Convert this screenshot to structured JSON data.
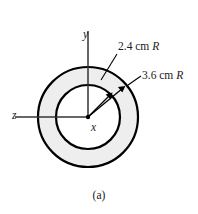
{
  "figure": {
    "caption": "(a)",
    "center": {
      "x": 88,
      "y": 117
    },
    "annulus": {
      "inner_radius_px": 32,
      "outer_radius_px": 50,
      "ring_fill_color": "#eeeeee",
      "inner_fill_color": "#ffffff",
      "stroke_color": "#000000",
      "stroke_width_px": 2.2
    },
    "dimensions": [
      {
        "name": "inner-radius",
        "value": "2.4",
        "unit": "cm",
        "symbol": "R",
        "text": "2.4 cm R"
      },
      {
        "name": "outer-radius",
        "value": "3.6",
        "unit": "cm",
        "symbol": "R",
        "text": "3.6 cm R"
      }
    ],
    "axes": [
      {
        "name": "y-axis",
        "label": "y",
        "direction": "up"
      },
      {
        "name": "z-axis",
        "label": "z",
        "direction": "left"
      },
      {
        "name": "x-axis",
        "label": "x",
        "direction": "out-of-page"
      }
    ],
    "arrows": [
      {
        "name": "inner-radius-arrow",
        "from": "origin",
        "to": "inner-circle",
        "angle_deg": 45
      },
      {
        "name": "outer-radius-arrow",
        "from": "origin",
        "to": "outer-circle",
        "angle_deg": 40
      }
    ]
  },
  "chart_data": {
    "type": "diagram",
    "title": "(a)",
    "annotations": [
      "2.4 cm R",
      "3.6 cm R",
      "y",
      "z",
      "x",
      "(a)"
    ],
    "values": [
      2.4,
      3.6
    ],
    "units": "cm",
    "categories": [
      "inner radius",
      "outer radius"
    ]
  }
}
